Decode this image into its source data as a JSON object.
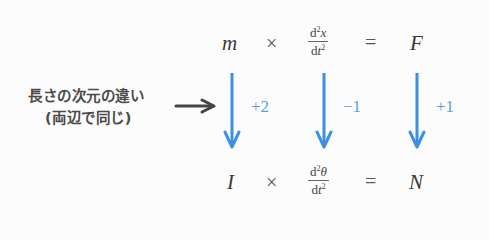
{
  "top_equation": {
    "term1": "m",
    "op1": "×",
    "fraction": {
      "num_d": "d",
      "num_exp": "2",
      "num_var": "x",
      "den_d": "d",
      "den_var": "t",
      "den_exp": "2"
    },
    "op2": "=",
    "rhs": "F"
  },
  "bottom_equation": {
    "term1": "I",
    "op1": "×",
    "fraction": {
      "num_d": "d",
      "num_exp": "2",
      "num_var": "θ",
      "den_d": "d",
      "den_var": "t",
      "den_exp": "2"
    },
    "op2": "=",
    "rhs": "N"
  },
  "arrows": [
    {
      "delta": "+2"
    },
    {
      "delta": "−1"
    },
    {
      "delta": "+1"
    }
  ],
  "annotation": {
    "line1": "長さの次元の違い",
    "line2": "(両辺で同じ)"
  },
  "colors": {
    "arrow": "#3d8fe0",
    "delta_text": "#5a9fd6",
    "pointer_arrow": "#444444"
  }
}
